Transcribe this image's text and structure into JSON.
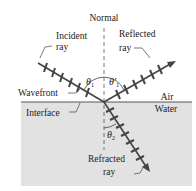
{
  "diagram": {
    "labels": {
      "normal": "Normal",
      "incident_1": "Incident",
      "incident_2": "ray",
      "reflected_1": "Reflected",
      "reflected_2": "ray",
      "wavefront": "Wavefront",
      "interface": "Interface",
      "air": "Air",
      "water": "Water",
      "refracted_1": "Refracted",
      "refracted_2": "ray"
    },
    "angles": {
      "theta1": "θ",
      "theta1_sub": "1",
      "theta1p": "θ′",
      "theta1p_sub": "1",
      "theta2": "θ",
      "theta2_sub": "2"
    },
    "colors": {
      "water": "#e2e2e2",
      "interface": "#444444",
      "ray": "#444444"
    }
  }
}
